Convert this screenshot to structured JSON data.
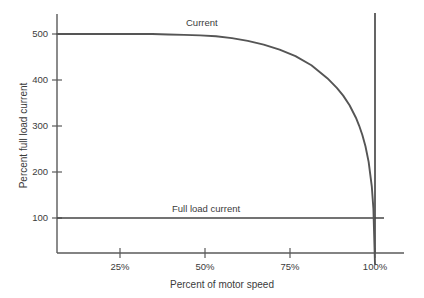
{
  "chart_data": {
    "type": "line",
    "title": "",
    "subtitle": "",
    "xlabel": "Percent of motor speed",
    "ylabel": "Percent full load current",
    "xlim": [
      0,
      104
    ],
    "ylim": [
      0,
      560
    ],
    "grid": false,
    "legend_position": "inline-annotations",
    "x_ticks": [
      {
        "value": 25,
        "label": "25%"
      },
      {
        "value": 50,
        "label": "50%"
      },
      {
        "value": 75,
        "label": "75%"
      },
      {
        "value": 100,
        "label": "100%"
      }
    ],
    "y_ticks": [
      {
        "value": 100,
        "label": "100"
      },
      {
        "value": 200,
        "label": "200"
      },
      {
        "value": 300,
        "label": "300"
      },
      {
        "value": 400,
        "label": "400"
      },
      {
        "value": 500,
        "label": "500"
      }
    ],
    "series": [
      {
        "name": "Current",
        "annotation": "Current",
        "color": "#555555",
        "x": [
          0,
          5,
          10,
          15,
          20,
          25,
          30,
          35,
          40,
          45,
          50,
          55,
          60,
          65,
          70,
          75,
          80,
          85,
          88,
          90,
          92,
          94,
          95,
          96,
          97,
          98,
          99,
          99.5,
          100
        ],
        "values": [
          500,
          500,
          500,
          500,
          500,
          500,
          500,
          499,
          498,
          497,
          495,
          491,
          485,
          477,
          466,
          452,
          432,
          404,
          383,
          366,
          345,
          318,
          301,
          281,
          256,
          222,
          168,
          120,
          0
        ]
      },
      {
        "name": "Full load current",
        "annotation": "Full load current",
        "color": "#444444",
        "x": [
          0,
          100
        ],
        "values": [
          100,
          100
        ]
      }
    ],
    "annotations": [
      {
        "text": "Current",
        "x": 46,
        "y": 530
      },
      {
        "text": "Full load current",
        "x": 42,
        "y": 128
      }
    ],
    "reference_lines": [
      {
        "name": "full-speed-marker",
        "orientation": "vertical",
        "x": 100,
        "y_from": 0,
        "y_to": 560,
        "color": "#555555"
      }
    ]
  },
  "colors": {
    "background": "#ffffff",
    "axis": "#5a5a5a",
    "curve": "#555555",
    "full_load_line": "#444444",
    "text": "#3b3b3b"
  }
}
